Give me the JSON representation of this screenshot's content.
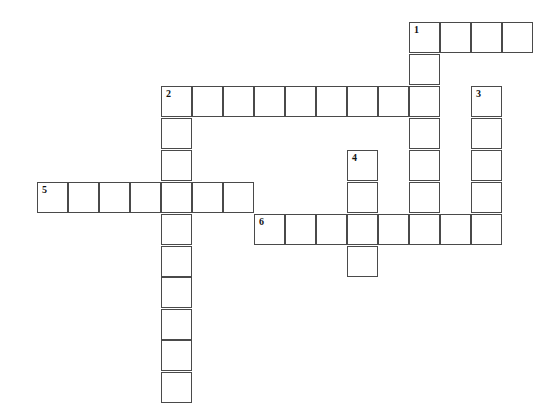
{
  "puzzle": {
    "type": "crossword",
    "colors": {
      "grid_line": "#4a4a4a",
      "cell_bg": "#ffffff",
      "number": "#111111"
    },
    "layout": {
      "col_x": [
        37,
        68,
        99,
        130,
        161,
        192,
        223,
        254,
        285,
        316,
        347,
        378,
        409,
        440,
        471,
        502
      ],
      "row_y": [
        22,
        54,
        86,
        118,
        150,
        182,
        214,
        246,
        277,
        309,
        340,
        372
      ],
      "cell_size": 31
    },
    "words": [
      {
        "number": "1",
        "direction": "across",
        "row": 0,
        "col": 12,
        "length": 4
      },
      {
        "number": "1",
        "direction": "down",
        "row": 0,
        "col": 12,
        "length": 7
      },
      {
        "number": "2",
        "direction": "across",
        "row": 2,
        "col": 4,
        "length": 9
      },
      {
        "number": "2",
        "direction": "down",
        "row": 2,
        "col": 4,
        "length": 10
      },
      {
        "number": "3",
        "direction": "down",
        "row": 2,
        "col": 14,
        "length": 5
      },
      {
        "number": "4",
        "direction": "down",
        "row": 4,
        "col": 10,
        "length": 4
      },
      {
        "number": "5",
        "direction": "across",
        "row": 5,
        "col": 0,
        "length": 7
      },
      {
        "number": "6",
        "direction": "across",
        "row": 6,
        "col": 7,
        "length": 8
      }
    ]
  }
}
